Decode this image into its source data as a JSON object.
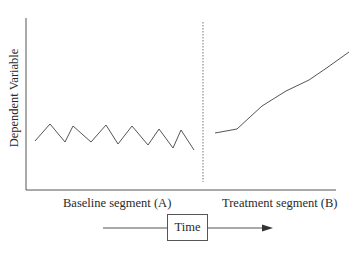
{
  "diagram": {
    "type": "single-case-design-AB",
    "y_axis_label": "Dependent Variable",
    "segments": [
      {
        "label": "Baseline segment (A)"
      },
      {
        "label": "Treatment segment (B)"
      }
    ],
    "time_label": "Time",
    "colors": {
      "line": "#555555",
      "axis": "#555555",
      "phase_divider": "#777777",
      "text": "#2a2a2a"
    },
    "baseline_points": [
      [
        35,
        141
      ],
      [
        50,
        124
      ],
      [
        65,
        142
      ],
      [
        73,
        126
      ],
      [
        91,
        142
      ],
      [
        106,
        125
      ],
      [
        118,
        144
      ],
      [
        132,
        126
      ],
      [
        148,
        145
      ],
      [
        159,
        129
      ],
      [
        173,
        148
      ],
      [
        181,
        130
      ],
      [
        194,
        150
      ]
    ],
    "treatment_points": [
      [
        215,
        133
      ],
      [
        237,
        129
      ],
      [
        262,
        106
      ],
      [
        286,
        91
      ],
      [
        309,
        80
      ],
      [
        328,
        67
      ],
      [
        349,
        52
      ]
    ]
  }
}
